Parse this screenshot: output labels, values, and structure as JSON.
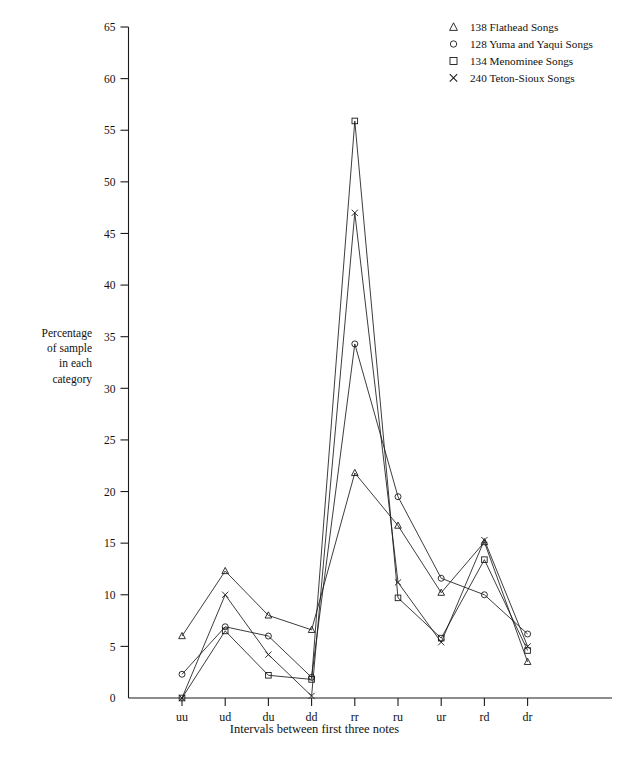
{
  "chart_data": {
    "type": "line",
    "title": "",
    "xlabel": "Intervals between first three notes",
    "ylabel": "Percentage\nof sample\nin each\ncategory",
    "categories": [
      "uu",
      "ud",
      "du",
      "dd",
      "rr",
      "ru",
      "ur",
      "rd",
      "dr"
    ],
    "ylim": [
      0,
      65
    ],
    "ytick_step": 5,
    "yticks": [
      0,
      5,
      10,
      15,
      20,
      25,
      30,
      35,
      40,
      45,
      50,
      55,
      60,
      65
    ],
    "grid": false,
    "legend_position": "top-right",
    "series": [
      {
        "name": "138 Flathead Songs",
        "marker": "triangle",
        "marker_symbol": "Δ",
        "values": [
          6.0,
          12.3,
          8.0,
          6.6,
          21.8,
          16.7,
          10.2,
          15.1,
          3.5
        ]
      },
      {
        "name": "128 Yuma and Yaqui Songs",
        "marker": "circle",
        "marker_symbol": "o",
        "values": [
          2.3,
          6.9,
          6.0,
          2.0,
          34.3,
          19.5,
          11.6,
          10.0,
          6.2
        ]
      },
      {
        "name": "134 Menominee Songs",
        "marker": "square",
        "marker_symbol": "□",
        "values": [
          0.0,
          6.5,
          2.2,
          1.8,
          55.9,
          9.7,
          5.8,
          13.4,
          4.6
        ]
      },
      {
        "name": "240 Teton-Sioux Songs",
        "marker": "cross",
        "marker_symbol": "X",
        "values": [
          0.0,
          10.0,
          4.2,
          0.2,
          47.0,
          11.2,
          5.4,
          15.3,
          5.0
        ]
      }
    ]
  },
  "axis": {
    "ylabel_lines": [
      "Percentage",
      "of sample",
      "in each",
      "category"
    ],
    "xlabel": "Intervals between first three notes"
  },
  "legend": {
    "entries": [
      {
        "symbol": "Δ",
        "label": "138 Flathead Songs"
      },
      {
        "symbol": "o",
        "label": "128 Yuma and Yaqui Songs"
      },
      {
        "symbol": "□",
        "label": "134 Menominee Songs"
      },
      {
        "symbol": "X",
        "label": "240 Teton-Sioux Songs"
      }
    ]
  },
  "colors": {
    "ink": "#1a1a1a",
    "background": "#ffffff"
  }
}
